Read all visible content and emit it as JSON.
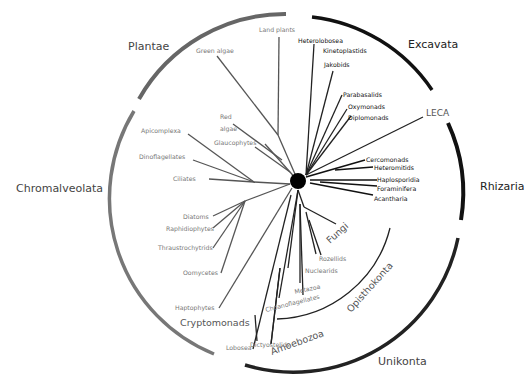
{
  "diagram": {
    "root": {
      "label": "LECA",
      "color": "#000000"
    },
    "supergroups": [
      {
        "name": "Plantae",
        "arc_color": "#666666"
      },
      {
        "name": "Excavata",
        "arc_color": "#111111"
      },
      {
        "name": "Rhizaria",
        "arc_color": "#111111"
      },
      {
        "name": "Unikonta",
        "arc_color": "#222222"
      },
      {
        "name": "Chromalveolata",
        "arc_color": "#777777"
      }
    ],
    "clades": {
      "cryptomonads": "Cryptomonads",
      "fungi": "Fungi",
      "opisthokonta": "Opisthokonta",
      "amoebozoa": "Amoebozoa"
    },
    "taxa": {
      "plantae": [
        "Land plants",
        "Green algae",
        "Red",
        "algae",
        "Glaucophytes"
      ],
      "excavata": [
        "Heterolobosea",
        "Kinetoplastids",
        "Jakobids",
        "Parabasalids",
        "Oxymonads",
        "Diplomonads"
      ],
      "rhizaria": [
        "Cercomonads",
        "Heteromitids",
        "Haplosporidia",
        "Foraminifera",
        "Acantharia"
      ],
      "chromalveolata": [
        "Apicomplexa",
        "Dinoflagellates",
        "Ciliates",
        "Diatoms",
        "Raphidiophytes",
        "Thraustrochytrids",
        "Oomycetes",
        "Haptophytes"
      ],
      "opisthokonta": [
        "Rozellids",
        "Nuclearids",
        "Metazoa",
        "Choanoflagellates"
      ],
      "amoebozoa": [
        "Dictyostelids",
        "Lobosea"
      ]
    }
  }
}
